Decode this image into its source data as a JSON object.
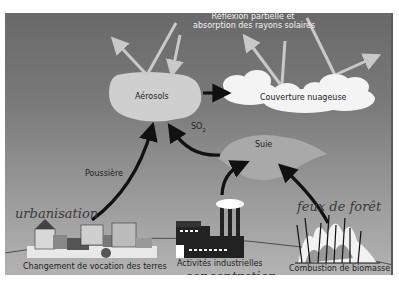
{
  "diagram": {
    "title_label": "Réflexion partielle et",
    "title_label_line2": "absorption des rayons solaires",
    "nodes": {
      "aerosols": "Aérosols",
      "clouds": "Couverture nuageuse",
      "soot": "Suie",
      "so2": "SO",
      "so2_sub": "2",
      "dust": "Poussière"
    },
    "sources": {
      "land_use": "Changement de vocation des terres",
      "industry": "Activités industrielles",
      "biomass": "Combustion de biomasse"
    },
    "handwritten_annotations": {
      "land_use": "urbanisation",
      "industry": "concentration",
      "biomass": "feux de forêt"
    },
    "colors": {
      "background_top": "#696969",
      "background_bottom": "#b3b3b3",
      "aerosol_blob": "#cfcfcf",
      "soot_blob": "#a9a9a9",
      "cloud": "#f4f4f4",
      "arrow": "#111111",
      "light_ray": "#c9c9c9"
    }
  }
}
